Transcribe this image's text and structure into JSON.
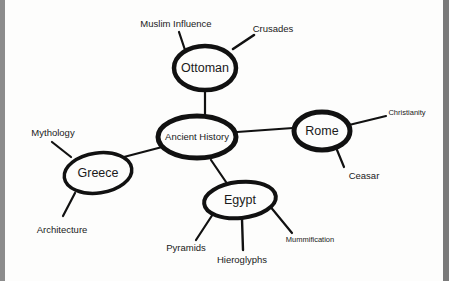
{
  "diagram": {
    "type": "mind-map",
    "center": {
      "label": "Ancient History"
    },
    "branches": [
      {
        "label": "Ottoman",
        "children": [
          "Muslim Influence",
          "Crusades"
        ]
      },
      {
        "label": "Rome",
        "children": [
          "Christianity",
          "Ceasar"
        ]
      },
      {
        "label": "Greece",
        "children": [
          "Mythology",
          "Architecture"
        ]
      },
      {
        "label": "Egypt",
        "children": [
          "Pyramids",
          "Hieroglyphs",
          "Mummification"
        ]
      }
    ]
  },
  "colors": {
    "ink": "#111111",
    "background": "#fdfdfc",
    "border": "#7a7a7a"
  }
}
